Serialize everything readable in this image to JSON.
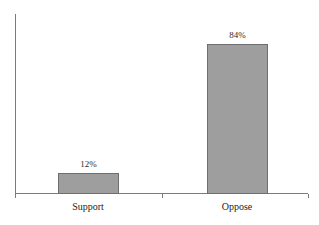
{
  "chart_data": {
    "type": "bar",
    "title": "",
    "xlabel": "",
    "ylabel": "",
    "categories": [
      "Support",
      "Oppose"
    ],
    "values": [
      12,
      84
    ],
    "value_labels": [
      "12%",
      "84%"
    ],
    "ylim": [
      0,
      100
    ],
    "grid": false,
    "legend": null,
    "bar_color": "#9e9e9e",
    "bar_border_color": "#6e6e6e",
    "axis_color": "#7b7b7b",
    "background": "#ffffff",
    "series": [
      {
        "name": "",
        "values": [
          12,
          84
        ]
      }
    ],
    "points": [
      {
        "category": "Support",
        "value": 12,
        "label": "12%"
      },
      {
        "category": "Oppose",
        "value": 84,
        "label": "84%"
      }
    ]
  }
}
